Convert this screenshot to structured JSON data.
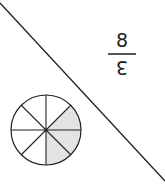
{
  "figure": {
    "fraction": {
      "numerator_display": "8",
      "denominator_display": "3",
      "orientation": "upside-down",
      "reads_as": "3/8"
    },
    "circle": {
      "total_parts": 8,
      "shaded_parts": 3,
      "shade_color": "#e3e3e3",
      "stroke_color": "#222222"
    },
    "diagonal_line": {
      "from": [
        0,
        3
      ],
      "to": [
        165,
        181
      ],
      "color": "#222222"
    }
  }
}
